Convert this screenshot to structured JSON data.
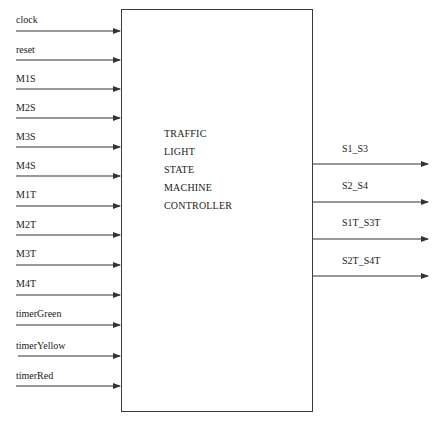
{
  "block": {
    "title_lines": [
      "TRAFFIC",
      "LIGHT",
      "STATE",
      "MACHINE",
      "CONTROLLER"
    ]
  },
  "inputs": [
    {
      "name": "clock"
    },
    {
      "name": "reset"
    },
    {
      "name": "M1S"
    },
    {
      "name": "M2S"
    },
    {
      "name": "M3S"
    },
    {
      "name": "M4S"
    },
    {
      "name": "M1T"
    },
    {
      "name": "M2T"
    },
    {
      "name": "M3T"
    },
    {
      "name": "M4T"
    },
    {
      "name": "timerGreen"
    },
    {
      "name": "timerYellow"
    },
    {
      "name": "timerRed"
    }
  ],
  "outputs": [
    {
      "name": "S1_S3"
    },
    {
      "name": "S2_S4"
    },
    {
      "name": "S1T_S3T"
    },
    {
      "name": "S2T_S4T"
    }
  ],
  "colors": {
    "line": "#333333",
    "text": "#1a1a1a",
    "background": "#ffffff"
  }
}
